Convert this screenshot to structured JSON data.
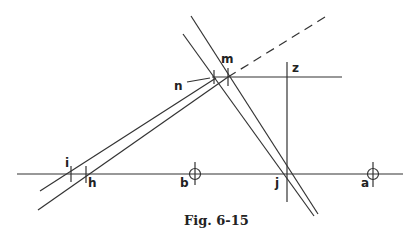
{
  "figure": {
    "caption": "Fig. 6-15",
    "labels": {
      "m": "m",
      "n": "n",
      "z": "z",
      "i": "i",
      "h": "h",
      "b": "b",
      "j": "j",
      "a": "a"
    },
    "line_color": "#222222"
  }
}
